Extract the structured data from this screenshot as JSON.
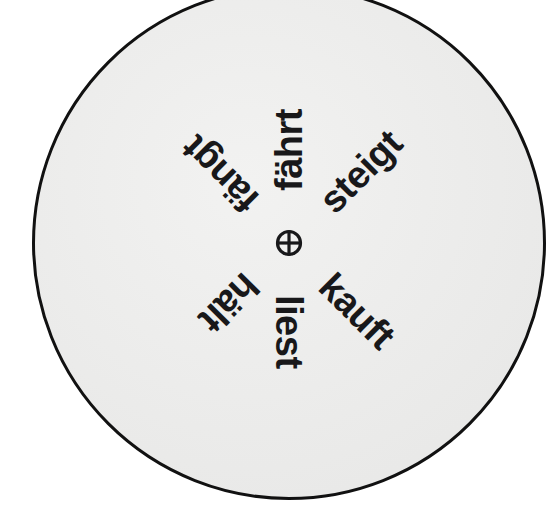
{
  "figure": {
    "kind": "radial-word-wheel",
    "disc": {
      "fill_color": "#ededec",
      "stroke_color": "#111111",
      "center_x": 289,
      "center_y": 243,
      "radius": 257
    },
    "center_mark": {
      "name": "circled-plus",
      "glyph": "⊕",
      "color": "#18181a"
    },
    "spokes": [
      {
        "label": "fährt",
        "bearing_deg": -90,
        "clock": "12:00",
        "radius_px": 52
      },
      {
        "label": "steigt",
        "bearing_deg": -45,
        "clock": "01:30",
        "radius_px": 52
      },
      {
        "label": "kauft",
        "bearing_deg": 45,
        "clock": "04:30",
        "radius_px": 52
      },
      {
        "label": "liest",
        "bearing_deg": 90,
        "clock": "06:00",
        "radius_px": 52
      },
      {
        "label": "hält",
        "bearing_deg": 135,
        "clock": "07:30",
        "radius_px": 52
      },
      {
        "label": "fängt",
        "bearing_deg": -135,
        "clock": "10:30",
        "radius_px": 52
      }
    ]
  }
}
